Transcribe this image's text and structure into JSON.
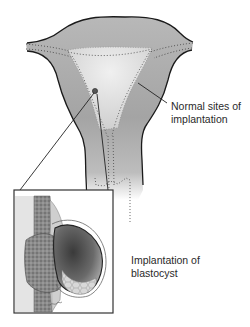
{
  "labels": {
    "normal_sites": {
      "line1": "Normal sites of",
      "line2": "implantation"
    },
    "blastocyst": {
      "line1": "Implantation of",
      "line2": "blastocyst"
    }
  },
  "colors": {
    "uterus_fill": "#a8a8a8",
    "cavity_fill": "#e6e6e6",
    "outline": "#1a1a1a",
    "text": "#2a2a2a",
    "inset_border": "#333333"
  }
}
